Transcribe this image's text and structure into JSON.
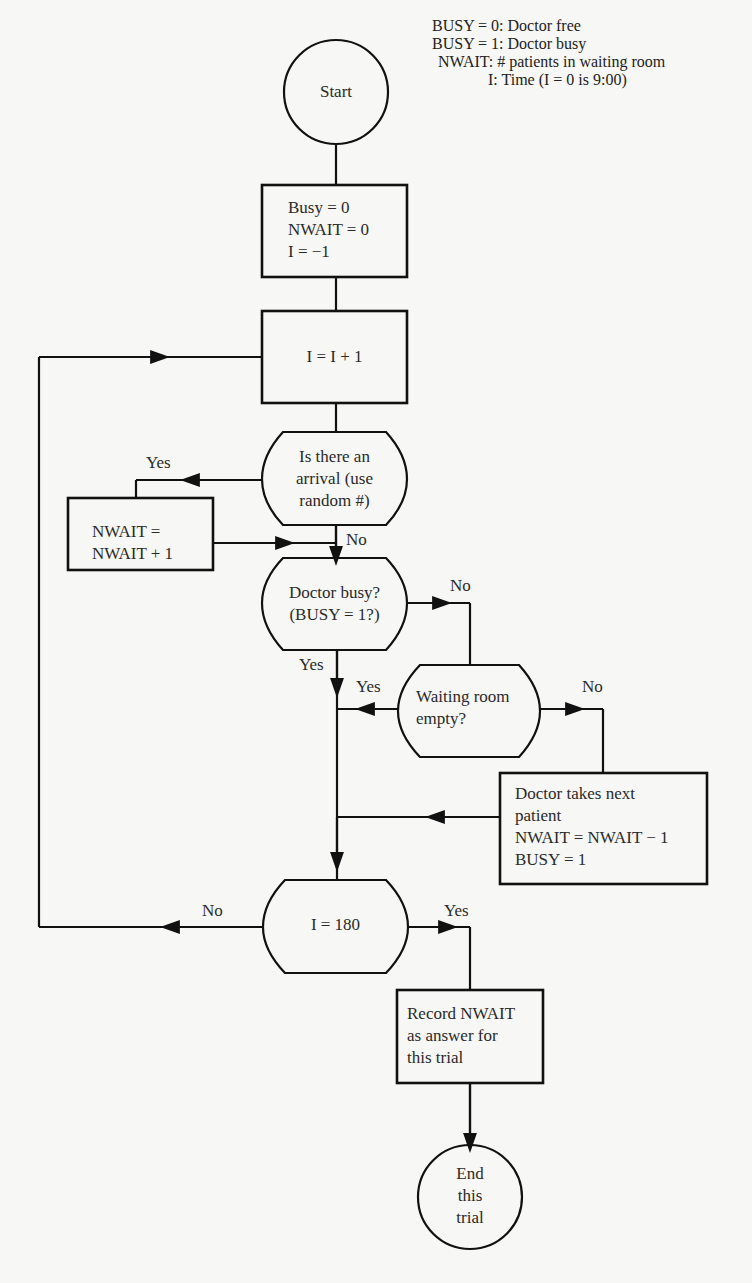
{
  "legend": {
    "items": [
      "BUSY = 0:  Doctor free",
      "BUSY = 1:  Doctor busy",
      "NWAIT:  # patients in waiting room",
      "I:  Time (I = 0 is 9:00)"
    ]
  },
  "nodes": {
    "start": {
      "label": "Start"
    },
    "init": {
      "lines": [
        "Busy = 0",
        "NWAIT = 0",
        "I = −1"
      ]
    },
    "increment": {
      "label": "I = I + 1"
    },
    "arrival": {
      "lines": [
        "Is there an",
        "arrival (use",
        "random #)"
      ]
    },
    "add_wait": {
      "lines": [
        "NWAIT =",
        "NWAIT + 1"
      ]
    },
    "doctor_busy": {
      "lines": [
        "Doctor busy?",
        "(BUSY = 1?)"
      ]
    },
    "waiting_empty": {
      "lines": [
        "Waiting room",
        "empty?"
      ]
    },
    "doctor_takes": {
      "lines": [
        "Doctor takes next",
        "patient",
        "NWAIT = NWAIT − 1",
        "BUSY = 1"
      ]
    },
    "check_end": {
      "label": "I = 180"
    },
    "record": {
      "lines": [
        "Record NWAIT",
        "as answer for",
        "this trial"
      ]
    },
    "end": {
      "lines": [
        "End",
        "this",
        "trial"
      ]
    }
  },
  "edge_labels": {
    "arrival_yes": "Yes",
    "arrival_no": "No",
    "busy_no": "No",
    "busy_yes": "Yes",
    "empty_yes": "Yes",
    "empty_no": "No",
    "end_no": "No",
    "end_yes": "Yes"
  }
}
